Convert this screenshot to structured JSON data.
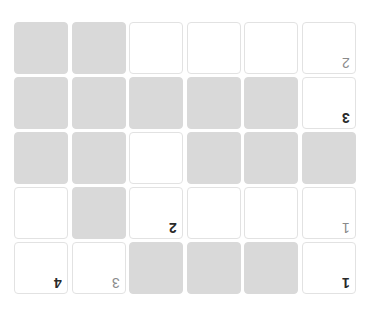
{
  "puzzle": {
    "orientation": "rotated-180",
    "rows": 5,
    "cols": 6,
    "colors": {
      "filled": "#d9d9d9",
      "empty": "#ffffff",
      "border": "#e2e2e2",
      "clue_dark": "#2a2a2a",
      "clue_light": "#8a8a8a"
    },
    "cells": [
      [
        {
          "state": "filled",
          "clue": ""
        },
        {
          "state": "filled",
          "clue": ""
        },
        {
          "state": "empty",
          "clue": ""
        },
        {
          "state": "empty",
          "clue": ""
        },
        {
          "state": "empty",
          "clue": ""
        },
        {
          "state": "empty",
          "clue": "2",
          "tone": "light"
        }
      ],
      [
        {
          "state": "filled",
          "clue": ""
        },
        {
          "state": "filled",
          "clue": ""
        },
        {
          "state": "filled",
          "clue": ""
        },
        {
          "state": "filled",
          "clue": ""
        },
        {
          "state": "filled",
          "clue": ""
        },
        {
          "state": "empty",
          "clue": "3",
          "tone": "dark"
        }
      ],
      [
        {
          "state": "filled",
          "clue": ""
        },
        {
          "state": "filled",
          "clue": ""
        },
        {
          "state": "empty",
          "clue": ""
        },
        {
          "state": "filled",
          "clue": ""
        },
        {
          "state": "filled",
          "clue": ""
        },
        {
          "state": "filled",
          "clue": ""
        }
      ],
      [
        {
          "state": "empty",
          "clue": ""
        },
        {
          "state": "filled",
          "clue": ""
        },
        {
          "state": "empty",
          "clue": "2",
          "tone": "dark"
        },
        {
          "state": "empty",
          "clue": ""
        },
        {
          "state": "empty",
          "clue": ""
        },
        {
          "state": "empty",
          "clue": "1",
          "tone": "light"
        }
      ],
      [
        {
          "state": "empty",
          "clue": "4",
          "tone": "dark"
        },
        {
          "state": "empty",
          "clue": "3",
          "tone": "light"
        },
        {
          "state": "filled",
          "clue": ""
        },
        {
          "state": "filled",
          "clue": ""
        },
        {
          "state": "filled",
          "clue": ""
        },
        {
          "state": "empty",
          "clue": "1",
          "tone": "dark"
        }
      ]
    ]
  }
}
